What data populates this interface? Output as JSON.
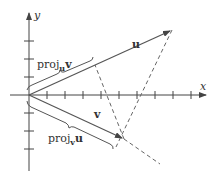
{
  "diagram": {
    "type": "vector projection",
    "axes": {
      "x_label": "x",
      "y_label": "y",
      "x_ticks": 9,
      "y_ticks_positive": 3,
      "y_ticks_negative": 3
    },
    "vectors": [
      {
        "name": "u",
        "label": "u"
      },
      {
        "name": "v",
        "label": "v"
      }
    ],
    "projections": [
      {
        "name": "proj_u_v",
        "base": "proj",
        "subscript": "u",
        "target": "v"
      },
      {
        "name": "proj_v_u",
        "base": "proj",
        "subscript": "v",
        "target": "u"
      }
    ],
    "colors": {
      "line": "#555555",
      "text": "#333333"
    }
  }
}
